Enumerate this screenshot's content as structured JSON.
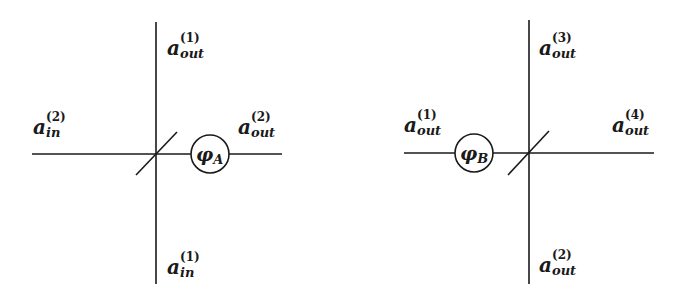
{
  "diagrams": [
    {
      "name": "beam-splitter-A",
      "phase_label": {
        "base": "φ",
        "sub": "A"
      },
      "labels": {
        "top": {
          "base": "a",
          "sub": "out",
          "sup": "(1)"
        },
        "left": {
          "base": "a",
          "sub": "in",
          "sup": "(2)"
        },
        "right": {
          "base": "a",
          "sub": "out",
          "sup": "(2)"
        },
        "bottom": {
          "base": "a",
          "sub": "in",
          "sup": "(1)"
        }
      }
    },
    {
      "name": "beam-splitter-B",
      "phase_label": {
        "base": "φ",
        "sub": "B"
      },
      "labels": {
        "top": {
          "base": "a",
          "sub": "out",
          "sup": "(3)"
        },
        "left": {
          "base": "a",
          "sub": "out",
          "sup": "(1)"
        },
        "right": {
          "base": "a",
          "sub": "out",
          "sup": "(4)"
        },
        "bottom": {
          "base": "a",
          "sub": "out",
          "sup": "(2)"
        }
      }
    }
  ],
  "colors": {
    "ink": "#1a1a1a",
    "background": "#ffffff"
  }
}
